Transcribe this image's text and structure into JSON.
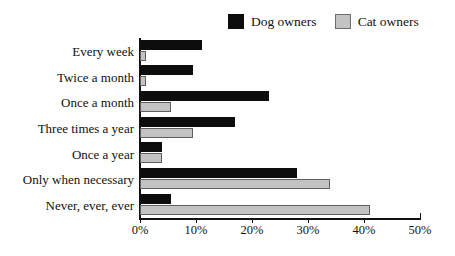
{
  "chart_data": {
    "type": "bar",
    "orientation": "horizontal",
    "title": "",
    "xlabel": "",
    "ylabel": "",
    "xlim": [
      0,
      50
    ],
    "xticks": [
      0,
      10,
      20,
      30,
      40,
      50
    ],
    "xtick_labels": [
      "0%",
      "10%",
      "20%",
      "30%",
      "40%",
      "50%"
    ],
    "grid": false,
    "legend_position": "top-right",
    "categories": [
      "Every week",
      "Twice a month",
      "Once a month",
      "Three times a year",
      "Once a year",
      "Only when necessary",
      "Never, ever, ever"
    ],
    "series": [
      {
        "name": "Dog owners",
        "color": "#0d0d0d",
        "values": [
          11,
          9.5,
          23,
          17,
          4,
          28,
          5.5
        ]
      },
      {
        "name": "Cat owners",
        "color": "#c3c3c3",
        "values": [
          1,
          1,
          5.5,
          9.5,
          4,
          34,
          41
        ]
      }
    ]
  },
  "legend": {
    "entries": [
      {
        "label": "Dog owners",
        "swatch": "legend-swatch-dog"
      },
      {
        "label": "Cat owners",
        "swatch": "legend-swatch-cat"
      }
    ]
  }
}
